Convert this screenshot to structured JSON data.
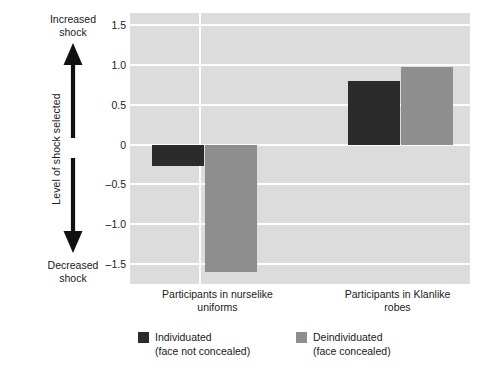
{
  "chart_data": {
    "type": "bar",
    "title": "",
    "xlabel": "",
    "ylabel": "Level of shock selected",
    "ylim": [
      -1.75,
      1.65
    ],
    "yticks": [
      1.5,
      1.0,
      0.5,
      0,
      -0.5,
      -1.0,
      -1.5
    ],
    "ytick_labels": [
      "1.5",
      "1.0",
      "0.5",
      "0",
      "–0.5",
      "–1.0",
      "–1.5"
    ],
    "grid": "horizontal-and-one-vertical",
    "legend_position": "bottom-left",
    "categories": [
      "Participants in nurselike uniforms",
      "Participants in Klanlike robes"
    ],
    "series": [
      {
        "name": "Individuated (face not concealed)",
        "color": "#2b2b2b",
        "values": [
          -0.27,
          0.8
        ]
      },
      {
        "name": "Deindividuated (face concealed)",
        "color": "#8e8e8e",
        "values": [
          -1.6,
          0.97
        ]
      }
    ]
  },
  "axis": {
    "y_title": "Level of shock selected",
    "direction_top": "Increased\nshock",
    "direction_top_line1": "Increased",
    "direction_top_line2": "shock",
    "direction_bottom_line1": "Decreased",
    "direction_bottom_line2": "shock",
    "tick_labels": [
      "1.5",
      "1.0",
      "0.5",
      "0",
      "–0.5",
      "–1.0",
      "–1.5"
    ]
  },
  "x_labels": [
    {
      "line1": "Participants in nurselike",
      "line2": "uniforms"
    },
    {
      "line1": "Participants in Klanlike",
      "line2": "robes"
    }
  ],
  "legend": {
    "items": [
      {
        "line1": "Individuated",
        "line2": "(face not concealed)",
        "color": "#2b2b2b"
      },
      {
        "line1": "Deindividuated",
        "line2": "(face concealed)",
        "color": "#8e8e8e"
      }
    ]
  },
  "colors": {
    "plot_background": "#dcdcdc",
    "gridline": "#fdfdfd",
    "series_dark": "#2b2b2b",
    "series_gray": "#8e8e8e",
    "page_background": "#ffffff",
    "text": "#202020"
  }
}
